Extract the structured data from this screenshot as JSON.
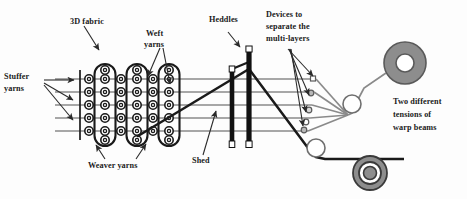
{
  "figure": {
    "background_color": "#fdfdfd",
    "width": 467,
    "height": 199
  },
  "colors": {
    "warp_line": "#8a8a8a",
    "shed_line": "#1a1a1a",
    "heddle_body": "#111111",
    "heddle_eye": "#ffffff",
    "beam_fill": "#8d8d8d",
    "beam_ring": "#555555",
    "beam_hub": "#ffffff",
    "roller_fill": "#ffffff",
    "roller_stroke": "#6f6f6f",
    "fabric_stroke": "#1a1a1a",
    "text": "#1a1a1a",
    "leader": "#2a2a2a"
  },
  "labels": {
    "fabric": "3D fabric",
    "weft_line1": "Weft",
    "weft_line2": "yarns",
    "stuffer_line1": "Stuffer",
    "stuffer_line2": "yarns",
    "weaver": "Weaver yarns",
    "shed": "Shed",
    "heddles": "Heddles",
    "devices_line1": "Devices to",
    "devices_line2": "separate the",
    "devices_line3": "multi-layers",
    "beams_line1": "Two different",
    "beams_line2": "tensions of",
    "beams_line3": "warp beams"
  },
  "fabric": {
    "description": "cross-section of multi-layer 3D woven fabric",
    "circle_rows": 5,
    "circle_columns": 6,
    "weaver_paths": 3,
    "circle_radius": 4.2,
    "inner_radius": 1.6,
    "col_x": [
      89,
      105,
      121,
      137,
      153,
      169
    ],
    "row_y": [
      79,
      92,
      105,
      118,
      131
    ],
    "left_edge_x": 80
  },
  "warp_lines": {
    "count": 5,
    "y_values": [
      79,
      92,
      105,
      118,
      131
    ],
    "x_start": 55,
    "x_end": 320
  },
  "heddles": {
    "count": 2,
    "items": [
      {
        "x": 232,
        "top": 69,
        "bottom": 147,
        "width": 4.6
      },
      {
        "x": 249,
        "top": 49,
        "bottom": 147,
        "width": 5.2
      }
    ]
  },
  "shed": {
    "apex_x": 249,
    "apex_y": 69,
    "left_x": 138,
    "left_y": 136,
    "right_x": 311,
    "right_y": 152
  },
  "separator_devices": {
    "count": 5,
    "markers": [
      {
        "x": 313,
        "y": 79,
        "shape": "square"
      },
      {
        "x": 311,
        "y": 96,
        "shape": "circle"
      },
      {
        "x": 309,
        "y": 113,
        "shape": "circle"
      },
      {
        "x": 306,
        "y": 126,
        "shape": "square"
      },
      {
        "x": 304,
        "y": 126,
        "shape": "circle"
      }
    ],
    "converge_x": 348,
    "converge_y": 115
  },
  "beams": [
    {
      "name": "upper-warp-beam",
      "cx": 405,
      "cy": 63,
      "r_outer": 21,
      "r_mid": 17,
      "r_inner": 9
    },
    {
      "name": "lower-warp-beam",
      "cx": 370,
      "cy": 173,
      "r_outer": 17,
      "r_mid": 13.5,
      "r_inner": 7
    }
  ],
  "rollers": [
    {
      "name": "upper-guide-roller",
      "cx": 352,
      "cy": 104,
      "r": 9
    },
    {
      "name": "lower-guide-roller",
      "cx": 316,
      "cy": 148,
      "r": 9
    }
  ]
}
